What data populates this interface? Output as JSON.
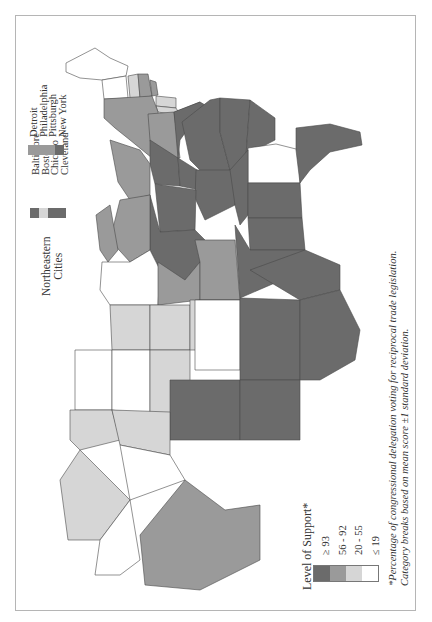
{
  "colors": {
    "level_ge_93": "#6b6b6b",
    "level_56_92": "#9a9a9a",
    "level_20_55": "#d6d6d6",
    "level_le_19": "#ffffff",
    "outline": "#4a4a4a",
    "frame": "#b5b5b5"
  },
  "legend_support": {
    "title": "Level of Support*",
    "items": [
      {
        "label": "≥ 93",
        "color": "#6b6b6b"
      },
      {
        "label": "56 - 92",
        "color": "#9a9a9a"
      },
      {
        "label": "20 - 55",
        "color": "#d6d6d6"
      },
      {
        "label": "≤ 19",
        "color": "#ffffff"
      }
    ]
  },
  "legend_cities": {
    "title_line1": "Northeastern",
    "title_line2": "Cities",
    "column1": [
      {
        "label": "Baltimore",
        "color": "#6b6b6b"
      },
      {
        "label": "Boston",
        "color": "#d6d6d6"
      },
      {
        "label": "Chicago",
        "color": "#6b6b6b"
      },
      {
        "label": "Cleveland",
        "color": "#6b6b6b"
      }
    ],
    "column2": [
      {
        "label": "Detroit",
        "color": "#9a9a9a"
      },
      {
        "label": "Philadelphia",
        "color": "#9a9a9a"
      },
      {
        "label": "Pittsburgh",
        "color": "#9a9a9a"
      },
      {
        "label": "New York",
        "color": "#6b6b6b"
      }
    ]
  },
  "footnote": {
    "line1": "*Percentage of congressional delegation voting for reciprocal trade legislation.",
    "line2": "Category breaks based on mean score ±1 standard deviation."
  }
}
